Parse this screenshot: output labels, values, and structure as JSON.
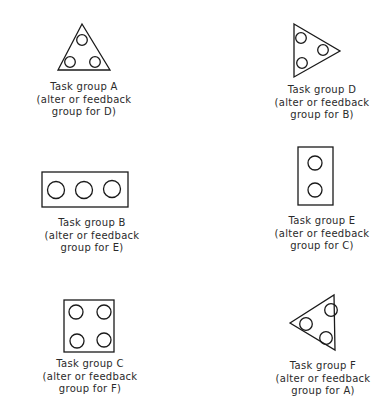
{
  "colors": {
    "stroke": "#1a1a1a",
    "text": "#2a2a2a",
    "background": "#ffffff"
  },
  "groups": [
    {
      "id": "A",
      "shape": "triangle-up",
      "circle_count": 3,
      "label": {
        "line1": "Task group A",
        "line2": "(alter or feedback",
        "line3": "group for D)"
      }
    },
    {
      "id": "D",
      "shape": "triangle-right",
      "circle_count": 3,
      "label": {
        "line1": "Task group D",
        "line2": "(alter or feedback",
        "line3": "group for B)"
      }
    },
    {
      "id": "B",
      "shape": "rectangle-horizontal",
      "circle_count": 3,
      "label": {
        "line1": "Task group B",
        "line2": "(alter or feedback",
        "line3": "group for E)"
      }
    },
    {
      "id": "E",
      "shape": "rectangle-vertical",
      "circle_count": 2,
      "label": {
        "line1": "Task group E",
        "line2": "(alter or feedback",
        "line3": "group for C)"
      }
    },
    {
      "id": "C",
      "shape": "square",
      "circle_count": 4,
      "label": {
        "line1": "Task group C",
        "line2": "(alter or feedback",
        "line3": "group for F)"
      }
    },
    {
      "id": "F",
      "shape": "triangle-left",
      "circle_count": 3,
      "label": {
        "line1": "Task group F",
        "line2": "(alter or feedback",
        "line3": "group for A)"
      }
    }
  ]
}
